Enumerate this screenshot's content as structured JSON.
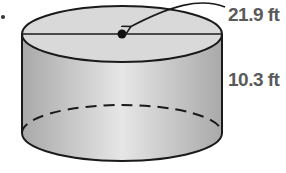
{
  "diagram": {
    "type": "cylinder",
    "labels": {
      "diameter": "21.9 ft",
      "height": "10.3 ft"
    },
    "colors": {
      "stroke": "#1a1a1a",
      "top_face": "#d9d9d9",
      "side_light": "#e6e6e6",
      "side_dark": "#a9a9a9",
      "label": "#5a5a5a"
    }
  }
}
